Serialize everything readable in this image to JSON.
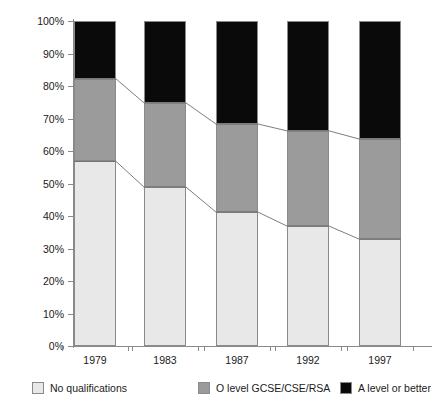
{
  "chart_data": {
    "type": "bar",
    "stacked": true,
    "stack_mode": "percent",
    "title": "",
    "subtitle": "",
    "xlabel": "",
    "ylabel": "",
    "categories": [
      "1979",
      "1983",
      "1987",
      "1992",
      "1997"
    ],
    "ylim": [
      0,
      100
    ],
    "ytick_labels": [
      "0%",
      "10%",
      "20%",
      "30%",
      "40%",
      "50%",
      "60%",
      "70%",
      "80%",
      "90%",
      "100%"
    ],
    "ytick_values": [
      0,
      10,
      20,
      30,
      40,
      50,
      60,
      70,
      80,
      90,
      100
    ],
    "grid": false,
    "legend_position": "bottom",
    "series": [
      {
        "name": "No qualifications",
        "color": "#e8e8e8",
        "values": [
          56.8,
          48.9,
          41.2,
          36.9,
          32.9
        ]
      },
      {
        "name": "O level GCSE/CSE/RSA",
        "color": "#9b9b9b",
        "values": [
          25.4,
          25.9,
          27.1,
          29.3,
          30.8
        ]
      },
      {
        "name": "A level or better",
        "color": "#0a0a0a",
        "values": [
          17.8,
          25.2,
          31.7,
          33.8,
          36.3
        ]
      }
    ],
    "cumulative_boundaries": {
      "no_qualifications_top": [
        56.8,
        48.9,
        41.2,
        36.9,
        32.9
      ],
      "o_level_top": [
        82.2,
        74.8,
        68.3,
        66.2,
        63.7
      ]
    },
    "annotations": [
      {
        "type": "connector-line",
        "name": "no-qualifications-boundary-line",
        "values": [
          56.8,
          48.9,
          41.2,
          36.9,
          32.9
        ]
      },
      {
        "type": "connector-line",
        "name": "o-level-boundary-line",
        "values": [
          82.2,
          74.8,
          68.3,
          66.2,
          63.7
        ]
      }
    ]
  },
  "legend": {
    "items": [
      {
        "label": "No qualifications",
        "color": "#e8e8e8"
      },
      {
        "label": "O level GCSE/CSE/RSA",
        "color": "#9b9b9b"
      },
      {
        "label": "A level or better",
        "color": "#0a0a0a"
      }
    ]
  },
  "axis": {
    "y_labels": [
      "100%",
      "90%",
      "80%",
      "70%",
      "60%",
      "50%",
      "40%",
      "30%",
      "20%",
      "10%",
      "0%"
    ],
    "x_labels": [
      "1979",
      "1983",
      "1987",
      "1992",
      "1997"
    ]
  }
}
